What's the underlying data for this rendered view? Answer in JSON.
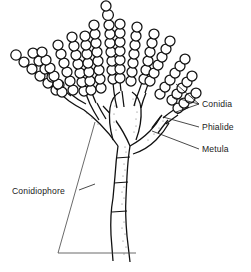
{
  "figure": {
    "title": "Conidiophore",
    "background_color": "#ffffff",
    "ink_color": "#111111",
    "label_color": "#1a1a1a",
    "width": 251,
    "height": 272
  },
  "labels": [
    {
      "id": "conidia",
      "text": "Conidia",
      "x": 202,
      "y": 107
    },
    {
      "id": "phialide",
      "text": "Phialide",
      "x": 202,
      "y": 130
    },
    {
      "id": "metula",
      "text": "Metula",
      "x": 202,
      "y": 152
    },
    {
      "id": "conidiophore",
      "text": "Conidiophore",
      "x": 12,
      "y": 194
    }
  ],
  "structures": [
    {
      "id": "conidia",
      "name": "Conidia",
      "description": "chains of spherical spores"
    },
    {
      "id": "phialide",
      "name": "Phialide",
      "description": "flask-shaped spore-producing cell"
    },
    {
      "id": "metula",
      "name": "Metula",
      "description": "branch bearing phialides"
    },
    {
      "id": "conidiophore",
      "name": "Conidiophore",
      "description": "stalk bearing the conidial head"
    }
  ]
}
